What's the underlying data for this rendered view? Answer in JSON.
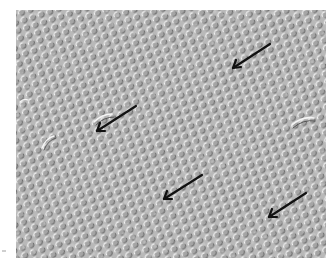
{
  "figure": {
    "type": "DIC microscopy image of dense cell layer",
    "background_color": "#b9b9b9",
    "cell_light_color": "#eeeeee",
    "cell_shadow_color": "#6e6e6e",
    "frame": {
      "x": 16,
      "y": 10,
      "width": 310,
      "height": 248
    }
  },
  "arrows": [
    {
      "id": "arrow-1",
      "tail": [
        270,
        44
      ],
      "head": [
        232,
        68
      ],
      "color": "#111111"
    },
    {
      "id": "arrow-2",
      "tail": [
        136,
        106
      ],
      "head": [
        96,
        132
      ],
      "color": "#111111"
    },
    {
      "id": "arrow-3",
      "tail": [
        202,
        175
      ],
      "head": [
        163,
        200
      ],
      "color": "#111111"
    },
    {
      "id": "arrow-4",
      "tail": [
        306,
        193
      ],
      "head": [
        268,
        218
      ],
      "color": "#111111"
    }
  ],
  "structures": [
    {
      "id": "curved-feature-left",
      "x": 100,
      "y": 118
    },
    {
      "id": "curved-feature-right",
      "x": 305,
      "y": 115
    },
    {
      "id": "curved-feature-lower-left",
      "x": 45,
      "y": 133
    }
  ]
}
